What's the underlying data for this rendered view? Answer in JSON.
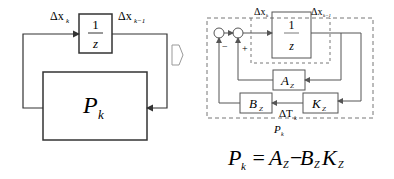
{
  "left_diagram": {
    "delay_block": {
      "numerator": "1",
      "denominator": "z"
    },
    "input_label": {
      "main": "Δx",
      "sub": "k"
    },
    "output_label": {
      "main": "Δx",
      "sub": "k−1"
    },
    "plant_block": {
      "main": "P",
      "sub": "k"
    }
  },
  "arrow": {
    "icon": "right-arrow-icon"
  },
  "right_diagram": {
    "delay_block": {
      "numerator": "1",
      "denominator": "z"
    },
    "input_label": {
      "main": "Δx",
      "sub": "k"
    },
    "output_label": {
      "main": "Δx",
      "sub": "k−1"
    },
    "sum_signs": {
      "minus": "−",
      "plus": "+"
    },
    "a_block": {
      "main": "A",
      "sub": "Z"
    },
    "b_block": {
      "main": "B",
      "sub": "Z"
    },
    "k_block": {
      "main": "K",
      "sub": "Z"
    },
    "dt_label": {
      "main": "ΔT",
      "sub": "k"
    },
    "group_label": {
      "main": "P",
      "sub": "k"
    }
  },
  "equation": {
    "lhs_main": "P",
    "lhs_sub": "k",
    "eq": " = ",
    "a_main": "A",
    "a_sub": "Z",
    "minus": "−",
    "b_main": "B",
    "b_sub": "Z",
    "k_main": "K",
    "k_sub": "Z"
  },
  "colors": {
    "line": "#333333",
    "block_stroke": "#555555",
    "dashed": "#777777"
  }
}
